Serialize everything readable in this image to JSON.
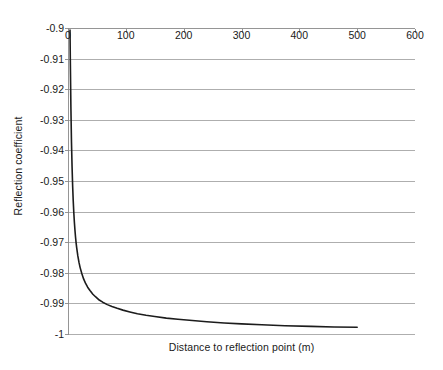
{
  "chart_data": {
    "type": "line",
    "title": "",
    "xlabel": "Distance to reflection point (m)",
    "ylabel": "Reflection coefficient",
    "xlim": [
      0,
      600
    ],
    "ylim": [
      -1,
      -0.9
    ],
    "xticks": [
      "0",
      "100",
      "200",
      "300",
      "400",
      "500",
      "600"
    ],
    "xtick_values": [
      0,
      100,
      200,
      300,
      400,
      500,
      600
    ],
    "yticks": [
      "-0.9",
      "-0.91",
      "-0.92",
      "-0.93",
      "-0.94",
      "-0.95",
      "-0.96",
      "-0.97",
      "-0.98",
      "-0.99",
      "-1"
    ],
    "ytick_values": [
      -0.9,
      -0.91,
      -0.92,
      -0.93,
      -0.94,
      -0.95,
      -0.96,
      -0.97,
      -0.98,
      -0.99,
      -1
    ],
    "grid": "horizontal",
    "grid_color": "#9a9a9a",
    "axis_color": "#8a8a8a",
    "line_color": "#1c1c1c",
    "line_width": 1.6,
    "xaxis_position": "top",
    "legend": "none",
    "series": [
      {
        "name": "Reflection coefficient",
        "x": [
          3.5,
          4,
          5,
          6,
          7,
          8,
          9,
          10,
          11,
          12,
          13,
          14,
          15,
          17,
          19,
          21,
          24,
          27,
          30,
          34,
          38,
          43,
          48,
          54,
          60,
          68,
          76,
          85,
          95,
          107,
          120,
          135,
          150,
          170,
          190,
          215,
          240,
          270,
          300,
          335,
          375,
          420,
          460,
          500
        ],
        "y": [
          -0.9007,
          -0.9101,
          -0.9257,
          -0.9372,
          -0.9452,
          -0.9515,
          -0.9563,
          -0.9602,
          -0.9634,
          -0.966,
          -0.9683,
          -0.9702,
          -0.9718,
          -0.9745,
          -0.9766,
          -0.9783,
          -0.9803,
          -0.982,
          -0.9833,
          -0.9847,
          -0.9858,
          -0.987,
          -0.9879,
          -0.9889,
          -0.9896,
          -0.9904,
          -0.991,
          -0.9916,
          -0.9922,
          -0.9928,
          -0.9934,
          -0.9939,
          -0.9943,
          -0.9948,
          -0.9952,
          -0.9956,
          -0.996,
          -0.9964,
          -0.9967,
          -0.997,
          -0.9973,
          -0.9975,
          -0.9977,
          -0.9978
        ]
      }
    ]
  }
}
